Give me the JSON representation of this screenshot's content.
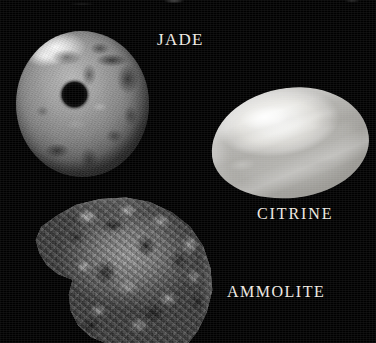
{
  "plate": {
    "background_color": "#000000",
    "width": 376,
    "height": 343,
    "caption_color": "#efeae2",
    "rendering": "grayscale-photograph"
  },
  "specimens": [
    {
      "id": "jade",
      "label": "JADE",
      "shape": "disc-with-central-hole",
      "description": "mottled gray bi disc with bright specular highlight at upper left and a round central perforation",
      "position": {
        "left": 16,
        "top": 31,
        "width": 133,
        "height": 146
      },
      "label_position": {
        "left": 157,
        "top": 31
      },
      "tone_light": "#cfcfcf",
      "tone_mid": "#8e8e8e",
      "tone_dark": "#3a3a3a"
    },
    {
      "id": "citrine",
      "label": "CITRINE",
      "shape": "oval-cabochon",
      "description": "bright pale translucent oval cabochon tilted slightly, with soft internal banding",
      "position": {
        "left": 211,
        "top": 88,
        "width": 158,
        "height": 110
      },
      "label_position": {
        "left": 257,
        "top": 206
      },
      "tone_light": "#ffffff",
      "tone_mid": "#e9e8e4",
      "tone_dark": "#b3b2ae"
    },
    {
      "id": "ammolite",
      "label": "AMMOLITE",
      "shape": "ammonite-shell-spiral",
      "description": "comma shaped fossil ammonite shell with a notched left margin and heavily brecciated cracked surface, cropped by the lower image edge",
      "position": {
        "left": 32,
        "top": 196,
        "width": 184,
        "height": 147
      },
      "label_position": {
        "left": 227,
        "top": 284
      },
      "tone_light": "#e6e6e6",
      "tone_mid": "#6e6e6e",
      "tone_dark": "#080808"
    }
  ]
}
